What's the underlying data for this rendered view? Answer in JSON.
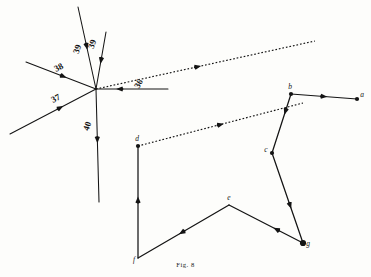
{
  "figure": {
    "caption_prefix": "F",
    "caption_rest": "IG",
    "caption_full": "FIG. 8",
    "caption_number": "8",
    "caption_text": "Fig. 8",
    "bleed_text": "",
    "ink_color": "#141414",
    "paper_color": "#fdfdfb"
  },
  "chart_data": {
    "type": "diagram",
    "title": "Fig. 8",
    "subtitle": "Surveying traverse with numbered bearing lines and lettered stations",
    "xlabel": "",
    "ylabel": "",
    "grid": false,
    "legend": "none",
    "xlim": [
      0,
      371
    ],
    "ylim": [
      0,
      277
    ],
    "hub": {
      "x": 96,
      "y": 89
    },
    "numbered_lines": [
      {
        "label": "36",
        "label_x": 141,
        "label_y": 85,
        "label_rotation": -62,
        "x1": 96,
        "y1": 89,
        "x2": 168,
        "y2": 89,
        "style": "solid",
        "arrow_at": 0.72,
        "arrow_direction": "toward-hub"
      },
      {
        "label": "37",
        "label_x": 57,
        "label_y": 101,
        "label_rotation": -28,
        "x1": 96,
        "y1": 89,
        "x2": 10,
        "y2": 134,
        "style": "solid",
        "arrow_at": 0.62,
        "arrow_direction": "toward-hub"
      },
      {
        "label": "38",
        "label_x": 60,
        "label_y": 70,
        "label_rotation": -28,
        "x1": 96,
        "y1": 89,
        "x2": 26,
        "y2": 62,
        "style": "solid",
        "arrow_at": 0.58,
        "arrow_direction": "toward-hub"
      },
      {
        "label": "39",
        "label_x": 80,
        "label_y": 50,
        "label_rotation": -72,
        "x1": 96,
        "y1": 89,
        "x2": 78,
        "y2": 7,
        "style": "solid",
        "arrow_at": 0.52,
        "arrow_direction": "toward-hub"
      },
      {
        "label": "39",
        "label_x": 95,
        "label_y": 45,
        "label_rotation": -72,
        "x1": 96,
        "y1": 89,
        "x2": 106,
        "y2": 32,
        "style": "solid",
        "arrow_at": 0.56,
        "arrow_direction": "toward-hub"
      },
      {
        "label": "40",
        "label_x": 90,
        "label_y": 127,
        "label_rotation": -72,
        "x1": 96,
        "y1": 89,
        "x2": 99,
        "y2": 202,
        "style": "solid",
        "arrow_at": 0.48,
        "arrow_direction": "away-from-hub"
      }
    ],
    "dotted_lines": [
      {
        "name": "upper-sight-line",
        "x1": 96,
        "y1": 89,
        "x2": 315,
        "y2": 41,
        "style": "dotted",
        "arrow_at": 0.48
      },
      {
        "name": "lower-sight-line",
        "x1": 138,
        "y1": 146,
        "x2": 303,
        "y2": 103,
        "style": "dotted",
        "arrow_at": 0.52
      }
    ],
    "traverse": {
      "name": "lettered-traverse",
      "stations": [
        {
          "label": "a",
          "x": 357,
          "y": 99,
          "marker": "filled-dot"
        },
        {
          "label": "b",
          "x": 291,
          "y": 94,
          "marker": "filled-dot"
        },
        {
          "label": "c",
          "x": 272,
          "y": 153,
          "marker": "filled-dot"
        },
        {
          "label": "d",
          "x": 138,
          "y": 146,
          "marker": "filled-dot"
        },
        {
          "label": "e",
          "x": 229,
          "y": 205,
          "marker": "none"
        },
        {
          "label": "f",
          "x": 138,
          "y": 258,
          "marker": "none"
        },
        {
          "label": "g",
          "x": 303,
          "y": 243,
          "marker": "filled-blob"
        }
      ],
      "segments": [
        {
          "from": "b",
          "to": "a",
          "arrow_at": 0.55
        },
        {
          "from": "b",
          "to": "c",
          "arrow_at": 0.35
        },
        {
          "from": "c",
          "to": "g",
          "arrow_at": 0.62
        },
        {
          "from": "g",
          "to": "e",
          "arrow_at": 0.4
        },
        {
          "from": "e",
          "to": "f",
          "arrow_at": 0.55
        },
        {
          "from": "f",
          "to": "d",
          "arrow_at": 0.55
        }
      ]
    }
  }
}
